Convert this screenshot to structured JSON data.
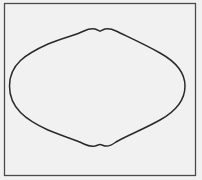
{
  "figure": {
    "background": "#f1f1f1",
    "frame": {
      "x": 4.5,
      "y": 3.5,
      "width": 191,
      "height": 172,
      "stroke": "#4a4a4a",
      "stroke_width": 1.3
    },
    "curve": {
      "shape": "closed lens-shaped curve with small notches at top and bottom",
      "stroke": "#2a2a2a",
      "stroke_width": 1.5,
      "left_extreme": [
        9.5,
        86
      ],
      "right_extreme": [
        185,
        86
      ],
      "top_notch": [
        100,
        31
      ],
      "bottom_notch": [
        100,
        145
      ]
    }
  }
}
